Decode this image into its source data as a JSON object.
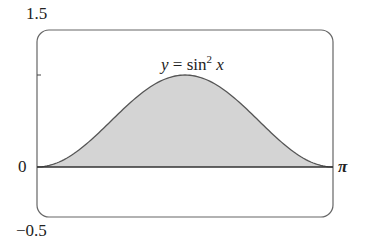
{
  "chart_data": {
    "type": "area",
    "function": "sin(x)^2",
    "xlabel": "",
    "ylabel": "",
    "xlim": [
      0,
      3.14159
    ],
    "ylim": [
      -0.5,
      1.5
    ],
    "x_tick_labels": [
      "π"
    ],
    "y_tick_labels": [
      "1.5",
      "0",
      "−0.5"
    ],
    "y_ticks": [
      1
    ],
    "grid": false,
    "fill_color": "#d4d4d4",
    "line_color": "#555555",
    "x": [
      0,
      0.3927,
      0.7854,
      1.1781,
      1.5708,
      1.9635,
      2.3562,
      2.7489,
      3.1416
    ],
    "values": [
      0,
      0.1464,
      0.5,
      0.8536,
      1,
      0.8536,
      0.5,
      0.1464,
      0
    ]
  },
  "labels": {
    "y_top": "1.5",
    "y_zero": "0",
    "y_bottom": "−0.5",
    "x_right": "π",
    "eq_y": "y",
    "eq_eq": " = sin",
    "eq_sup": "2",
    "eq_x": "x"
  }
}
